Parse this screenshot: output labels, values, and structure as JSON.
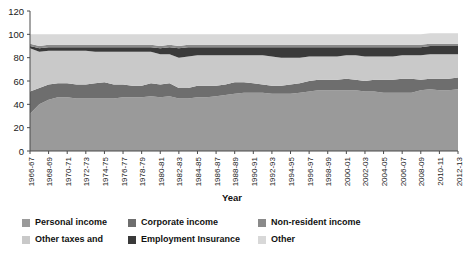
{
  "chart_data": {
    "type": "area",
    "stacked": true,
    "title": "",
    "xlabel": "Year",
    "ylabel": "",
    "ylim": [
      0,
      120
    ],
    "yticks": [
      0,
      20,
      40,
      60,
      80,
      100,
      120
    ],
    "grid": false,
    "legend_position": "bottom",
    "x": [
      "1966-67",
      "1967-68",
      "1968-69",
      "1969-70",
      "1970-71",
      "1971-72",
      "1972-73",
      "1973-74",
      "1974-75",
      "1975-76",
      "1976-77",
      "1977-78",
      "1978-79",
      "1979-80",
      "1980-81",
      "1981-82",
      "1982-83",
      "1983-84",
      "1984-85",
      "1985-86",
      "1986-87",
      "1987-88",
      "1988-89",
      "1989-90",
      "1990-91",
      "1991-92",
      "1992-93",
      "1993-94",
      "1994-95",
      "1995-96",
      "1996-97",
      "1997-98",
      "1998-99",
      "1999-00",
      "2000-01",
      "2001-02",
      "2002-03",
      "2003-04",
      "2004-05",
      "2005-06",
      "2006-07",
      "2007-08",
      "2008-09",
      "2009-10",
      "2010-11",
      "2011-12",
      "2012-13"
    ],
    "xtick_labels": [
      "1966-67",
      "1968-69",
      "1970-71",
      "1972-73",
      "1974-75",
      "1976-77",
      "1978-79",
      "1980-81",
      "1982-83",
      "1984-85",
      "1986-87",
      "1988-89",
      "1990-91",
      "1992-93",
      "1994-95",
      "1996-97",
      "1998-99",
      "2000-01",
      "2002-03",
      "2004-05",
      "2006-07",
      "2008-09",
      "2010-11",
      "2012-13"
    ],
    "series": [
      {
        "name": "Personal income",
        "color": "#9a9a9a",
        "values": [
          32,
          40,
          44,
          46,
          46,
          45,
          45,
          45,
          45,
          45,
          46,
          46,
          46,
          47,
          46,
          47,
          45,
          45,
          46,
          46,
          47,
          48,
          49,
          50,
          50,
          50,
          49,
          49,
          49,
          50,
          51,
          52,
          52,
          52,
          52,
          52,
          51,
          51,
          50,
          50,
          50,
          50,
          52,
          53,
          52,
          52,
          53
        ]
      },
      {
        "name": "Corporate income",
        "color": "#6e6e6e",
        "values": [
          19,
          14,
          13,
          12,
          12,
          12,
          12,
          13,
          14,
          12,
          11,
          10,
          10,
          11,
          11,
          11,
          9,
          9,
          10,
          10,
          9,
          9,
          10,
          9,
          8,
          7,
          7,
          7,
          8,
          8,
          9,
          9,
          9,
          9,
          10,
          9,
          9,
          10,
          11,
          11,
          12,
          12,
          9,
          9,
          10,
          10,
          10
        ]
      },
      {
        "name": "Other taxes and",
        "color": "#c9c9c9",
        "values": [
          37,
          31,
          29,
          28,
          28,
          29,
          29,
          27,
          26,
          28,
          28,
          29,
          29,
          27,
          26,
          25,
          26,
          27,
          26,
          26,
          26,
          25,
          23,
          23,
          24,
          25,
          25,
          24,
          23,
          22,
          21,
          20,
          20,
          20,
          20,
          21,
          21,
          20,
          20,
          20,
          20,
          20,
          21,
          21,
          21,
          21,
          20
        ]
      },
      {
        "name": "Employment Insurance",
        "color": "#3a3a3a",
        "values": [
          2,
          3,
          3,
          3,
          3,
          3,
          3,
          4,
          4,
          4,
          4,
          4,
          4,
          4,
          5,
          6,
          8,
          8,
          7,
          7,
          7,
          7,
          7,
          7,
          7,
          7,
          8,
          9,
          9,
          9,
          8,
          8,
          8,
          8,
          7,
          7,
          8,
          8,
          8,
          8,
          7,
          7,
          7,
          7,
          7,
          7,
          7
        ]
      },
      {
        "name": "Non-resident income",
        "color": "#8a8a8a",
        "values": [
          2,
          2,
          2,
          2,
          2,
          2,
          2,
          2,
          2,
          2,
          2,
          2,
          2,
          2,
          2,
          2,
          2,
          2,
          2,
          2,
          2,
          2,
          2,
          2,
          2,
          2,
          2,
          2,
          2,
          2,
          2,
          2,
          2,
          2,
          2,
          2,
          2,
          2,
          2,
          2,
          2,
          2,
          2,
          2,
          2,
          2,
          2
        ]
      },
      {
        "name": "Other",
        "color": "#d8d8d8",
        "values": [
          8,
          10,
          9,
          9,
          9,
          9,
          9,
          9,
          9,
          9,
          9,
          9,
          9,
          9,
          10,
          9,
          10,
          9,
          9,
          9,
          9,
          9,
          9,
          9,
          9,
          9,
          9,
          9,
          9,
          9,
          9,
          9,
          9,
          9,
          9,
          9,
          9,
          9,
          9,
          9,
          9,
          9,
          9,
          9,
          9,
          9,
          9
        ]
      }
    ]
  },
  "axes": {
    "x_title": "Year"
  },
  "legend": {
    "items": [
      {
        "label": "Personal income",
        "color": "#9a9a9a"
      },
      {
        "label": "Corporate income",
        "color": "#6e6e6e"
      },
      {
        "label": "Non-resident income",
        "color": "#8a8a8a"
      },
      {
        "label": "Other taxes and",
        "color": "#c9c9c9"
      },
      {
        "label": "Employment Insurance",
        "color": "#3a3a3a"
      },
      {
        "label": "Other",
        "color": "#d8d8d8"
      }
    ]
  }
}
